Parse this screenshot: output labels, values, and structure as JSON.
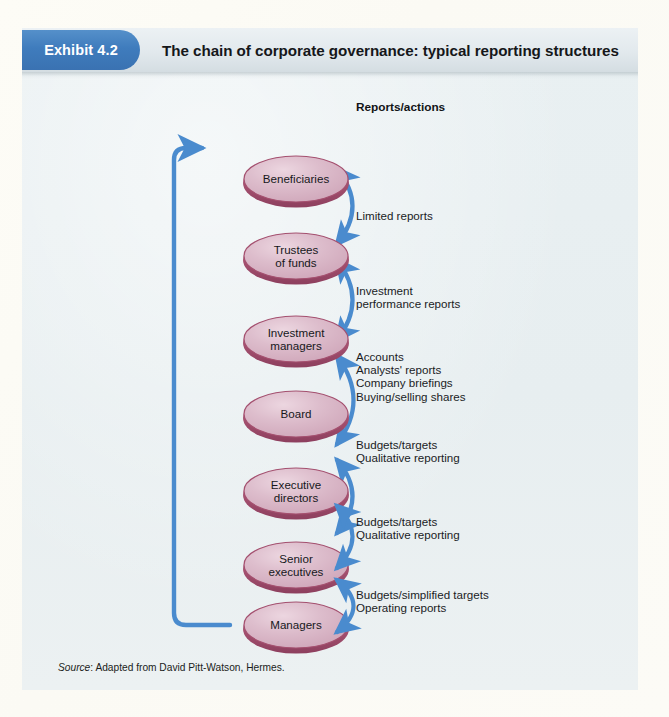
{
  "exhibit": {
    "badge_label": "Exhibit 4.2",
    "title": "The chain of corporate governance: typical reporting structures"
  },
  "diagram": {
    "column_heading": "Reports/actions",
    "nodes": [
      {
        "id": "beneficiaries",
        "label_line1": "Beneficiaries",
        "label_line2": ""
      },
      {
        "id": "trustees",
        "label_line1": "Trustees",
        "label_line2": "of funds"
      },
      {
        "id": "investment-managers",
        "label_line1": "Investment",
        "label_line2": "managers"
      },
      {
        "id": "board",
        "label_line1": "Board",
        "label_line2": ""
      },
      {
        "id": "executive-directors",
        "label_line1": "Executive",
        "label_line2": "directors"
      },
      {
        "id": "senior-executives",
        "label_line1": "Senior",
        "label_line2": "executives"
      },
      {
        "id": "managers",
        "label_line1": "Managers",
        "label_line2": ""
      }
    ],
    "links": [
      {
        "from": "beneficiaries",
        "to": "trustees",
        "lines": [
          "Limited reports"
        ]
      },
      {
        "from": "trustees",
        "to": "investment-managers",
        "lines": [
          "Investment",
          "performance reports"
        ]
      },
      {
        "from": "investment-managers",
        "to": "board",
        "lines": [
          "Accounts",
          "Analysts' reports",
          "Company briefings",
          "Buying/selling shares"
        ]
      },
      {
        "from": "board",
        "to": "executive-directors",
        "lines": [
          "Budgets/targets",
          "Qualitative reporting"
        ]
      },
      {
        "from": "executive-directors",
        "to": "senior-executives",
        "lines": [
          "Budgets/targets",
          "Qualitative reporting"
        ]
      },
      {
        "from": "senior-executives",
        "to": "managers",
        "lines": [
          "Budgets/simplified targets",
          "Operating reports"
        ]
      }
    ],
    "feedback_loop": {
      "from": "managers",
      "to": "beneficiaries"
    }
  },
  "source": {
    "prefix": "Source",
    "text": ": Adapted from David Pitt-Watson, Hermes."
  },
  "colors": {
    "badge_blue": "#3f7cbd",
    "arrow_blue": "#4a8bce",
    "node_fill": "#ddbccb",
    "node_border": "#a4506f",
    "panel_bg": "#e9eff1",
    "page_bg": "#fbfaf5",
    "text": "#16181b"
  }
}
